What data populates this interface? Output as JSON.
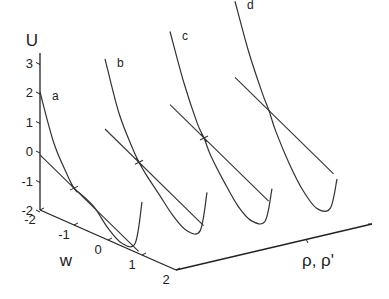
{
  "chart_data": {
    "type": "line",
    "title": "",
    "zlabel": "U",
    "xlabel": "w",
    "ylabel": "ρ, ρ'",
    "zlim": [
      -2,
      3
    ],
    "xlim": [
      -2,
      2
    ],
    "z_ticks": [
      "3",
      "2",
      "1",
      "0",
      "-1",
      "-2"
    ],
    "x_ticks": [
      "-2",
      "-1",
      "0",
      "1",
      "2"
    ],
    "grid": false,
    "legend": "none",
    "series": [
      {
        "name": "a",
        "description": "potential U(w) with tangent line and marked inflection point",
        "w": [
          -2.0,
          -1.6,
          -1.2,
          -1.0,
          -0.8,
          -0.4,
          0.0,
          0.4,
          0.8,
          1.0
        ],
        "U": [
          2.0,
          0.5,
          -0.4,
          -0.75,
          -0.85,
          -1.1,
          -1.6,
          -1.9,
          -1.7,
          -0.2
        ],
        "marker": {
          "w": -1.0,
          "U": -0.75
        }
      },
      {
        "name": "b",
        "w": [
          -2.0,
          -1.6,
          -1.2,
          -1.0,
          -0.8,
          -0.4,
          0.0,
          0.4,
          0.8,
          1.0
        ],
        "U": [
          2.6,
          1.0,
          0.0,
          -0.4,
          -0.7,
          -1.2,
          -1.7,
          -2.0,
          -1.8,
          -0.4
        ],
        "marker": {
          "w": -1.0,
          "U": -0.4
        }
      },
      {
        "name": "c",
        "w": [
          -2.0,
          -1.6,
          -1.2,
          -1.0,
          -0.8,
          -0.4,
          0.0,
          0.4,
          0.8,
          1.0
        ],
        "U": [
          3.0,
          1.5,
          0.3,
          -0.1,
          -0.6,
          -1.3,
          -1.9,
          -2.2,
          -2.0,
          -0.8
        ],
        "marker": {
          "w": -1.0,
          "U": -0.1
        }
      },
      {
        "name": "d",
        "w": [
          -2.0,
          -1.6,
          -1.2,
          -1.0,
          -0.8,
          -0.4,
          0.0,
          0.4,
          0.8,
          1.0
        ],
        "U": [
          3.5,
          2.0,
          0.8,
          0.3,
          -0.3,
          -1.2,
          -1.9,
          -2.3,
          -2.1,
          -1.0
        ],
        "marker": null
      }
    ]
  }
}
